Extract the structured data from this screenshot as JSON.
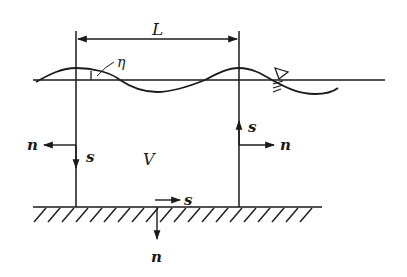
{
  "diagram": {
    "type": "control-volume wave diagram",
    "colors": {
      "ink": "#1a1a1a",
      "background": "#ffffff"
    },
    "labels": {
      "wavelength": "L",
      "surface_elevation": "η",
      "volume": "V",
      "left_normal": "n",
      "left_tangent": "s",
      "right_tangent": "s",
      "right_normal": "n",
      "bottom_tangent": "s",
      "bottom_normal": "n"
    },
    "elements": [
      "wavelength-dimension-arrow",
      "still-water-line",
      "free-surface-wave",
      "water-level-symbol",
      "left-boundary",
      "right-boundary",
      "seabed-with-hatching",
      "normal-and-tangent-vectors"
    ]
  }
}
